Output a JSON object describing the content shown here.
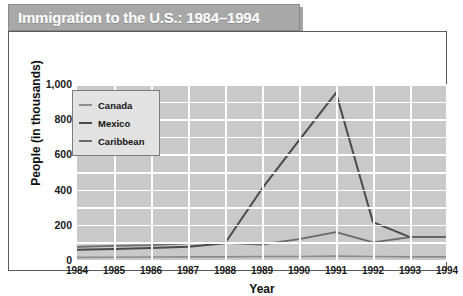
{
  "title": "Immigration to the U.S.: 1984–1994",
  "legend": {
    "position": "top-left",
    "items": [
      {
        "label": "Canada",
        "swatch": "line-swatch-icon"
      },
      {
        "label": "Mexico",
        "swatch": "line-swatch-icon"
      },
      {
        "label": "Caribbean",
        "swatch": "line-swatch-icon"
      }
    ]
  },
  "colors": {
    "banner_bg": "#a8a8a8",
    "banner_text": "#ffffff",
    "plot_bg": "#c9c9c9",
    "gridline": "#ffffff",
    "frame_border": "#5a5a5a",
    "canada_line": "#8c8c8c",
    "mexico_line": "#4a4a4a",
    "caribbean_line": "#6a6a6a"
  },
  "chart_data": {
    "type": "line",
    "title": "Immigration to the U.S.: 1984–1994",
    "xlabel": "Year",
    "ylabel": "People (in thousands)",
    "categories": [
      "1984",
      "1985",
      "1986",
      "1987",
      "1988",
      "1989",
      "1990",
      "1991",
      "1992",
      "1993",
      "1994"
    ],
    "x": [
      1984,
      1985,
      1986,
      1987,
      1988,
      1989,
      1990,
      1991,
      1992,
      1993,
      1994
    ],
    "ylim": [
      0,
      1000
    ],
    "yticks": [
      0,
      200,
      400,
      600,
      800,
      1000
    ],
    "ytick_labels": [
      "0",
      "200",
      "400",
      "600",
      "800",
      "1,000"
    ],
    "grid": true,
    "legend_position": "top-left",
    "series": [
      {
        "name": "Canada",
        "values": [
          15,
          16,
          17,
          18,
          18,
          20,
          20,
          22,
          20,
          18,
          18
        ]
      },
      {
        "name": "Mexico",
        "values": [
          58,
          62,
          68,
          75,
          95,
          405,
          680,
          950,
          215,
          130,
          130
        ]
      },
      {
        "name": "Caribbean",
        "values": [
          75,
          80,
          85,
          95,
          98,
          88,
          118,
          158,
          100,
          130,
          130
        ]
      }
    ]
  }
}
